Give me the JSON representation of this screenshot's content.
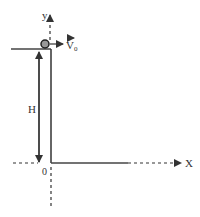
{
  "diagram": {
    "type": "projectile-launch-from-height",
    "labels": {
      "y_axis": "y",
      "x_axis": "X",
      "velocity": "V",
      "velocity_subscript": "0",
      "height": "H",
      "origin": "0"
    },
    "colors": {
      "line": "#333333",
      "ball_fill": "#888888"
    }
  }
}
